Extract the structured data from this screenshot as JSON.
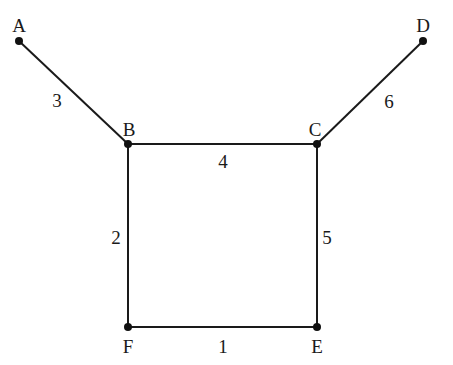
{
  "graph": {
    "nodes": [
      {
        "id": "A",
        "label": "A",
        "x": 19,
        "y": 41,
        "lx": 19,
        "ly": 32
      },
      {
        "id": "B",
        "label": "B",
        "x": 128,
        "y": 144,
        "lx": 129,
        "ly": 136
      },
      {
        "id": "C",
        "label": "C",
        "x": 317,
        "y": 144,
        "lx": 315,
        "ly": 136
      },
      {
        "id": "D",
        "label": "D",
        "x": 423,
        "y": 41,
        "lx": 423,
        "ly": 32
      },
      {
        "id": "E",
        "label": "E",
        "x": 317,
        "y": 327,
        "lx": 317,
        "ly": 353
      },
      {
        "id": "F",
        "label": "F",
        "x": 128,
        "y": 327,
        "lx": 128,
        "ly": 353
      }
    ],
    "edges": [
      {
        "from": "A",
        "to": "B",
        "weight": "3",
        "lx": 57,
        "ly": 107
      },
      {
        "from": "B",
        "to": "C",
        "weight": "4",
        "lx": 223,
        "ly": 168
      },
      {
        "from": "C",
        "to": "D",
        "weight": "6",
        "lx": 389,
        "ly": 108
      },
      {
        "from": "B",
        "to": "F",
        "weight": "2",
        "lx": 116,
        "ly": 244
      },
      {
        "from": "C",
        "to": "E",
        "weight": "5",
        "lx": 327,
        "ly": 244
      },
      {
        "from": "F",
        "to": "E",
        "weight": "1",
        "lx": 223,
        "ly": 353
      }
    ],
    "colors": {
      "stroke": "#1a1a1a",
      "node": "#111111",
      "background": "#ffffff"
    }
  }
}
